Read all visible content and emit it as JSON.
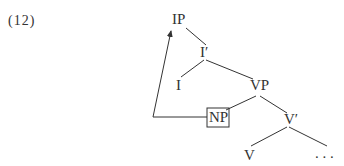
{
  "example_number": "(12)",
  "tree": {
    "nodes": {
      "IP": "IP",
      "Ibar": "I′",
      "I": "I",
      "VP": "VP",
      "NP": "NP",
      "Vbar": "V′",
      "V": "V",
      "ellipsis": ". . ."
    },
    "edges": [
      [
        "IP",
        "Ibar"
      ],
      [
        "Ibar",
        "I"
      ],
      [
        "Ibar",
        "VP"
      ],
      [
        "VP",
        "NP"
      ],
      [
        "VP",
        "Vbar"
      ],
      [
        "Vbar",
        "V"
      ],
      [
        "Vbar",
        "ellipsis"
      ]
    ],
    "movement_arrow": {
      "from": "NP",
      "to": "IP"
    },
    "boxed_node": "NP"
  }
}
